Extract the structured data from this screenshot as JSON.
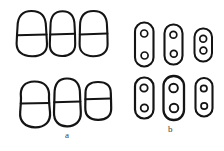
{
  "figure": {
    "background_color": "#ffffff",
    "stroke_color": "#1a1a1a",
    "label_color": "#3a3a3a",
    "width": 224,
    "height": 151
  },
  "panels": [
    {
      "id": "a",
      "label": "a",
      "label_x": 68,
      "label_y": 136,
      "description": "Rounded cells divided by a transverse septum, two rows of three",
      "cell_count": 6,
      "cells": [
        {
          "name": "cell-a1",
          "row": 1,
          "col": 1,
          "cx": 31,
          "cy": 33,
          "rx": 16,
          "ry": 22,
          "septum_y": 35,
          "shape": "rounded-rect",
          "inclusions": 0
        },
        {
          "name": "cell-a2",
          "row": 1,
          "col": 2,
          "cx": 62,
          "cy": 33,
          "rx": 13,
          "ry": 22,
          "septum_y": 35,
          "shape": "rounded-rect",
          "inclusions": 0
        },
        {
          "name": "cell-a3",
          "row": 1,
          "col": 3,
          "cx": 93,
          "cy": 33,
          "rx": 14,
          "ry": 22,
          "septum_y": 35,
          "shape": "rounded-rect",
          "inclusions": 0
        },
        {
          "name": "cell-a4",
          "row": 2,
          "col": 1,
          "cx": 35,
          "cy": 104,
          "rx": 16,
          "ry": 21,
          "septum_y": 104,
          "shape": "figure-eight",
          "inclusions": 0
        },
        {
          "name": "cell-a5",
          "row": 2,
          "col": 2,
          "cx": 67,
          "cy": 102,
          "rx": 14,
          "ry": 23,
          "septum_y": 102,
          "shape": "rounded-rect",
          "inclusions": 0
        },
        {
          "name": "cell-a6",
          "row": 2,
          "col": 3,
          "cx": 98,
          "cy": 101,
          "rx": 14,
          "ry": 18,
          "septum_y": 99,
          "shape": "rounded-rect",
          "inclusions": 0
        }
      ]
    },
    {
      "id": "b",
      "label": "b",
      "label_x": 171,
      "label_y": 132,
      "description": "Elongated capsule cells each containing two circular inclusions, two rows of three",
      "cell_count": 6,
      "cells": [
        {
          "name": "cell-b1",
          "row": 1,
          "col": 1,
          "cx": 144,
          "cy": 44,
          "rx": 9,
          "ry": 22,
          "shape": "capsule",
          "inclusions": 2,
          "inclusion_r": 3.4,
          "inclusion_offsets": [
            -11,
            11
          ]
        },
        {
          "name": "cell-b2",
          "row": 1,
          "col": 2,
          "cx": 173,
          "cy": 44,
          "rx": 9,
          "ry": 20,
          "shape": "capsule",
          "inclusions": 2,
          "inclusion_r": 3.4,
          "inclusion_offsets": [
            -9,
            9
          ]
        },
        {
          "name": "cell-b3",
          "row": 1,
          "col": 3,
          "cx": 203,
          "cy": 45,
          "rx": 9,
          "ry": 16,
          "shape": "capsule",
          "inclusions": 2,
          "inclusion_r": 3.4,
          "inclusion_offsets": [
            -6,
            6
          ]
        },
        {
          "name": "cell-b4",
          "row": 1,
          "col": 1,
          "cx": 144,
          "cy": 98,
          "rx": 9,
          "ry": 20,
          "shape": "capsule",
          "inclusions": 2,
          "inclusion_r": 3.6,
          "inclusion_offsets": [
            -9,
            9
          ]
        },
        {
          "name": "cell-b5",
          "row": 2,
          "col": 2,
          "cx": 174,
          "cy": 98,
          "rx": 10,
          "ry": 22,
          "shape": "capsule",
          "inclusions": 2,
          "inclusion_r": 4.2,
          "inclusion_offsets": [
            -10,
            10
          ]
        },
        {
          "name": "cell-b6",
          "row": 2,
          "col": 3,
          "cx": 204,
          "cy": 97,
          "rx": 8,
          "ry": 19,
          "shape": "capsule",
          "inclusions": 2,
          "inclusion_r": 3.2,
          "inclusion_offsets": [
            -8,
            8
          ]
        }
      ]
    }
  ]
}
